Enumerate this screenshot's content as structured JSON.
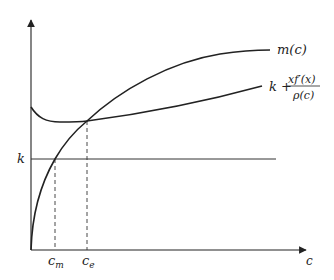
{
  "diagram": {
    "type": "economic-curves",
    "axes": {
      "x_label": "c",
      "y_label": ""
    },
    "horizontal_line": {
      "label": "k"
    },
    "curves": [
      {
        "name": "m-curve",
        "label": "m(c)"
      },
      {
        "name": "k-plus-curve",
        "label_prefix": "k +",
        "numerator": "xf′(x)",
        "denominator": "ρ(c)"
      }
    ],
    "markers": [
      {
        "name": "c-m",
        "label_base": "c",
        "label_sub": "m"
      },
      {
        "name": "c-e",
        "label_base": "c",
        "label_sub": "e"
      }
    ],
    "colors": {
      "ink": "#222222",
      "background": "#ffffff"
    }
  }
}
